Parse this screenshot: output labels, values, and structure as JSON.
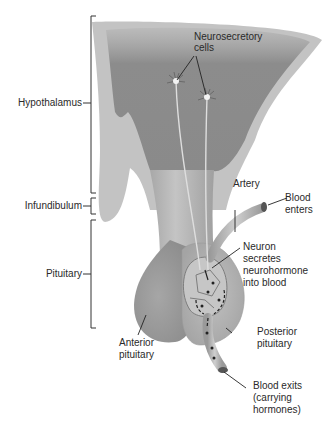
{
  "diagram": {
    "regions": [
      {
        "label": "Hypothalamus"
      },
      {
        "label": "Infundibulum"
      },
      {
        "label": "Pituitary"
      }
    ],
    "labels": {
      "neurosecretory": "Neurosecretory",
      "cells": "cells",
      "artery": "Artery",
      "blood_enters_1": "Blood",
      "blood_enters_2": "enters",
      "neuron_1": "Neuron",
      "neuron_2": "secretes",
      "neuron_3": "neurohormone",
      "neuron_4": "into blood",
      "anterior_1": "Anterior",
      "anterior_2": "pituitary",
      "posterior_1": "Posterior",
      "posterior_2": "pituitary",
      "exits_1": "Blood exits",
      "exits_2": "(carrying",
      "exits_3": "hormones)"
    },
    "colors": {
      "tissue_dark": "#8a8a8a",
      "tissue_light": "#b8b8b8",
      "tissue_mid": "#a0a0a0",
      "line": "#222222"
    }
  }
}
